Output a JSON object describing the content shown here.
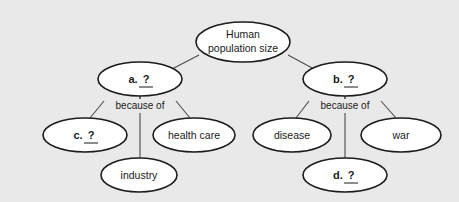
{
  "diagram": {
    "type": "concept-map",
    "background_color": "#e9e9e9",
    "node_fill_color": "#ffffff",
    "node_stroke_color": "#1c1c1c",
    "connector_color": "#4a4a4a",
    "nodes": {
      "root": {
        "id": "root",
        "line1": "Human",
        "line2": "population size",
        "bold": false,
        "cx": 243,
        "cy": 42,
        "rx": 47,
        "ry": 20
      },
      "a": {
        "id": "a",
        "label": "a.",
        "blank": "?",
        "bold": true,
        "cx": 140,
        "cy": 79,
        "rx": 42,
        "ry": 17
      },
      "b": {
        "id": "b",
        "label": "b.",
        "blank": "?",
        "bold": true,
        "cx": 345,
        "cy": 79,
        "rx": 42,
        "ry": 17
      },
      "c": {
        "id": "c",
        "label": "c.",
        "blank": "?",
        "bold": true,
        "cx": 85,
        "cy": 135,
        "rx": 42,
        "ry": 17
      },
      "health_care": {
        "id": "health_care",
        "label": "health care",
        "bold": false,
        "cx": 194,
        "cy": 135,
        "rx": 41,
        "ry": 17
      },
      "industry": {
        "id": "industry",
        "label": "industry",
        "bold": false,
        "cx": 139,
        "cy": 175,
        "rx": 38,
        "ry": 17
      },
      "disease": {
        "id": "disease",
        "label": "disease",
        "bold": false,
        "cx": 292,
        "cy": 135,
        "rx": 39,
        "ry": 17
      },
      "war": {
        "id": "war",
        "label": "war",
        "bold": false,
        "cx": 401,
        "cy": 135,
        "rx": 40,
        "ry": 17
      },
      "d": {
        "id": "d",
        "label": "d.",
        "blank": "?",
        "bold": true,
        "cx": 345,
        "cy": 175,
        "rx": 42,
        "ry": 17
      }
    },
    "edge_labels": {
      "left_because_of": {
        "text": "because of",
        "x": 140,
        "y": 106
      },
      "right_because_of": {
        "text": "because of",
        "x": 345,
        "y": 106
      }
    }
  }
}
